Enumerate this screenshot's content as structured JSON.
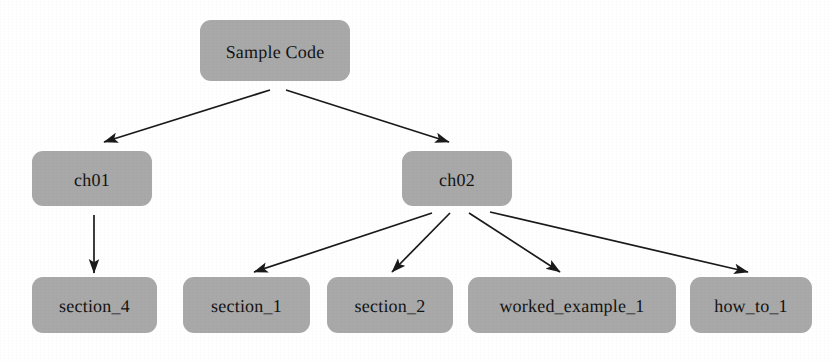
{
  "diagram": {
    "type": "tree",
    "colors": {
      "node_fill": "#a9a9a9",
      "node_text": "#131313",
      "edge": "#1a1a1a",
      "background": "#ffffff"
    },
    "nodes": [
      {
        "id": "sample_code",
        "label": "Sample Code",
        "x": 200,
        "y": 20,
        "w": 150,
        "h": 61,
        "level": 0
      },
      {
        "id": "ch01",
        "label": "ch01",
        "x": 32,
        "y": 151,
        "w": 120,
        "h": 55,
        "level": 1
      },
      {
        "id": "ch02",
        "label": "ch02",
        "x": 402,
        "y": 151,
        "w": 110,
        "h": 55,
        "level": 1
      },
      {
        "id": "section_4",
        "label": "section_4",
        "x": 32,
        "y": 277,
        "w": 125,
        "h": 56,
        "level": 2
      },
      {
        "id": "section_1",
        "label": "section_1",
        "x": 183,
        "y": 277,
        "w": 127,
        "h": 56,
        "level": 2
      },
      {
        "id": "section_2",
        "label": "section_2",
        "x": 327,
        "y": 277,
        "w": 126,
        "h": 56,
        "level": 2
      },
      {
        "id": "worked_example_1",
        "label": "worked_example_1",
        "x": 468,
        "y": 277,
        "w": 208,
        "h": 56,
        "level": 2
      },
      {
        "id": "how_to_1",
        "label": "how_to_1",
        "x": 690,
        "y": 277,
        "w": 122,
        "h": 56,
        "level": 2
      }
    ],
    "edges": [
      {
        "id": "edge-sample-code-to-ch01",
        "from": "sample_code",
        "to": "ch01",
        "x1": 270,
        "y1": 90,
        "x2": 104,
        "y2": 142
      },
      {
        "id": "edge-sample-code-to-ch02",
        "from": "sample_code",
        "to": "ch02",
        "x1": 286,
        "y1": 90,
        "x2": 449,
        "y2": 142
      },
      {
        "id": "edge-ch01-to-section-4",
        "from": "ch01",
        "to": "section_4",
        "x1": 94,
        "y1": 215,
        "x2": 94,
        "y2": 273
      },
      {
        "id": "edge-ch02-to-section-1",
        "from": "ch02",
        "to": "section_1",
        "x1": 432,
        "y1": 213,
        "x2": 254,
        "y2": 272
      },
      {
        "id": "edge-ch02-to-section-2",
        "from": "ch02",
        "to": "section_2",
        "x1": 450,
        "y1": 213,
        "x2": 392,
        "y2": 272
      },
      {
        "id": "edge-ch02-to-worked-example-1",
        "from": "ch02",
        "to": "worked_example_1",
        "x1": 469,
        "y1": 213,
        "x2": 560,
        "y2": 272
      },
      {
        "id": "edge-ch02-to-how-to-1",
        "from": "ch02",
        "to": "how_to_1",
        "x1": 490,
        "y1": 212,
        "x2": 748,
        "y2": 272
      }
    ]
  }
}
